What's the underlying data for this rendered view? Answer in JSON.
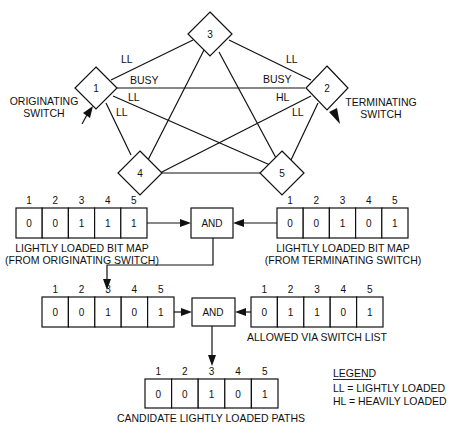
{
  "network": {
    "nodes": [
      {
        "id": "1",
        "label": "1"
      },
      {
        "id": "2",
        "label": "2"
      },
      {
        "id": "3",
        "label": "3"
      },
      {
        "id": "4",
        "label": "4"
      },
      {
        "id": "5",
        "label": "5"
      }
    ],
    "edges": [
      {
        "from": "1",
        "to": "3",
        "label": "LL"
      },
      {
        "from": "3",
        "to": "2",
        "label": "LL"
      },
      {
        "from": "1",
        "to": "2",
        "label_near_1": "BUSY",
        "label_near_2": "BUSY"
      },
      {
        "from": "1",
        "to": "5",
        "label": "LL"
      },
      {
        "from": "1",
        "to": "4",
        "label": "LL"
      },
      {
        "from": "2",
        "to": "4",
        "label": "HL"
      },
      {
        "from": "2",
        "to": "5",
        "label": "LL"
      },
      {
        "from": "3",
        "to": "4",
        "label": ""
      },
      {
        "from": "3",
        "to": "5",
        "label": ""
      },
      {
        "from": "4",
        "to": "5",
        "label": ""
      }
    ],
    "originating": {
      "line1": "ORIGINATING",
      "line2": "SWITCH"
    },
    "terminating": {
      "line1": "TERMINATING",
      "line2": "SWITCH"
    }
  },
  "bitmaps": {
    "originating": {
      "indices": [
        "1",
        "2",
        "3",
        "4",
        "5"
      ],
      "bits": [
        "0",
        "0",
        "1",
        "1",
        "1"
      ],
      "caption1": "LIGHTLY LOADED BIT MAP",
      "caption2": "(FROM ORIGINATING SWITCH)"
    },
    "terminating": {
      "indices": [
        "1",
        "2",
        "3",
        "4",
        "5"
      ],
      "bits": [
        "0",
        "0",
        "1",
        "0",
        "1"
      ],
      "caption1": "LIGHTLY LOADED BIT MAP",
      "caption2": "(FROM TERMINATING SWITCH)"
    },
    "intermediate": {
      "indices": [
        "1",
        "2",
        "3",
        "4",
        "5"
      ],
      "bits": [
        "0",
        "0",
        "1",
        "0",
        "1"
      ]
    },
    "allowed": {
      "indices": [
        "1",
        "2",
        "3",
        "4",
        "5"
      ],
      "bits": [
        "0",
        "1",
        "1",
        "0",
        "1"
      ],
      "caption1": "ALLOWED VIA SWITCH LIST"
    },
    "candidate": {
      "indices": [
        "1",
        "2",
        "3",
        "4",
        "5"
      ],
      "bits": [
        "0",
        "0",
        "1",
        "0",
        "1"
      ],
      "caption1": "CANDIDATE LIGHTLY LOADED PATHS"
    }
  },
  "gates": {
    "and1": "AND",
    "and2": "AND"
  },
  "legend": {
    "title": "LEGEND",
    "ll": "LL = LIGHTLY LOADED",
    "hl": "HL = HEAVILY LOADED"
  }
}
